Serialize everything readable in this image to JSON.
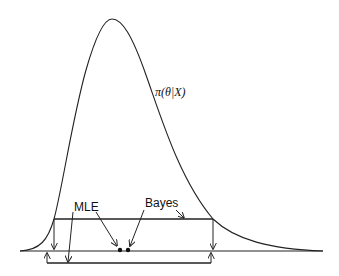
{
  "figure": {
    "curve_label": "π(θ|X)",
    "labels": {
      "mle": "MLE",
      "bayes": "Bayes"
    },
    "colors": {
      "stroke": "#222222",
      "background": "#ffffff"
    }
  }
}
